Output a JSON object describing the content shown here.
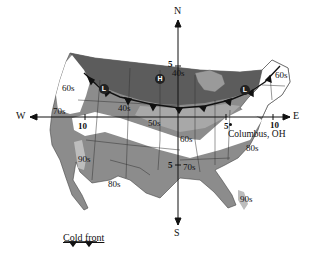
{
  "figure": {
    "type": "weather-map",
    "region": "Continental United States"
  },
  "compass": {
    "north": "N",
    "south": "S",
    "east": "E",
    "west": "W"
  },
  "axis_ticks": {
    "north_5": "5",
    "west_10": "10",
    "south_5": "5",
    "east_5": "5",
    "east_10": "10"
  },
  "pressure_systems": {
    "high": "H",
    "low_west": "L",
    "low_east": "L"
  },
  "temperature_labels": {
    "t_60s_northwest": "60s",
    "t_70s_west": "70s",
    "t_40s_center": "40s",
    "t_40s_north": "40s",
    "t_50s_center": "50s",
    "t_60s_northeast": "60s",
    "t_60s_midsouth": "60s",
    "t_70s_south": "70s",
    "t_80s_southeast": "80s",
    "t_90s_southwest": "90s",
    "t_80s_texas": "80s",
    "t_90s_florida": "90s"
  },
  "city": {
    "name": "Columbus, OH"
  },
  "legend": {
    "cold_front_label": "Cold front"
  },
  "colors": {
    "dark_band": "#6a6a6a",
    "mid_band": "#8c8c8c",
    "light_band": "#bdbdbd",
    "white_band": "#ffffff",
    "front_line": "#111111"
  }
}
